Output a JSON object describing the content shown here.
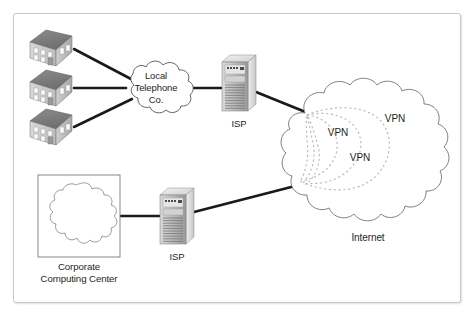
{
  "diagram": {
    "title_visible": false,
    "background": "#ffffff",
    "frame_border_color": "#c8c8c8",
    "line_color": "#1a1a1a",
    "cloud_stroke": "#808080",
    "vpn_tunnel_color": "#b5b5b5",
    "text_color": "#231f20"
  },
  "nodes": {
    "buildings": [
      {
        "name": "building-1",
        "x": 28,
        "y": 28
      },
      {
        "name": "building-2",
        "x": 28,
        "y": 68
      },
      {
        "name": "building-3",
        "x": 28,
        "y": 107
      }
    ],
    "telco_cloud": {
      "label": "Local\nTelephone\nCo.",
      "label_line_1": "Local",
      "label_line_2": "Telephone",
      "label_line_3": "Co.",
      "cx": 155,
      "cy": 89
    },
    "isp_top": {
      "label": "ISP",
      "x": 222,
      "y": 55
    },
    "isp_bottom": {
      "label": "ISP",
      "x": 160,
      "y": 188
    },
    "internet_cloud": {
      "label": "Internet",
      "cx": 368,
      "cy": 160
    },
    "corporate": {
      "label_line_1": "Corporate",
      "label_line_2": "Computing Center",
      "box_x": 38,
      "box_y": 175
    }
  },
  "vpn_tunnels": [
    {
      "label": "VPN",
      "id": "vpn-tunnel-outer"
    },
    {
      "label": "VPN",
      "id": "vpn-tunnel-middle"
    },
    {
      "label": "VPN",
      "id": "vpn-tunnel-inner"
    }
  ],
  "labels": {
    "vpn_1": "VPN",
    "vpn_2": "VPN",
    "vpn_3": "VPN",
    "internet": "Internet",
    "isp_1": "ISP",
    "isp_2": "ISP",
    "telco_1": "Local",
    "telco_2": "Telephone",
    "telco_3": "Co.",
    "corp_1": "Corporate",
    "corp_2": "Computing Center"
  }
}
